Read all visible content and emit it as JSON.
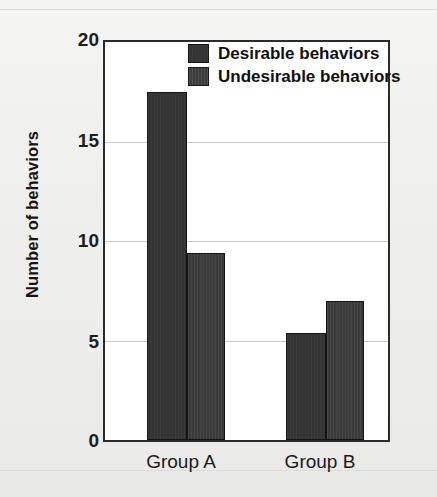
{
  "chart_data": {
    "type": "bar",
    "title": "",
    "subtitle": "",
    "xlabel": "",
    "ylabel": "Number of behaviors",
    "categories": [
      "Group A",
      "Group B"
    ],
    "series": [
      {
        "name": "Desirable behaviors",
        "values": [
          17.5,
          5.4
        ],
        "color": "#333333"
      },
      {
        "name": "Undesirable behaviors",
        "values": [
          9.4,
          7.0
        ],
        "color": "#3d3d3d"
      }
    ],
    "ylim": [
      0,
      20
    ],
    "yticks": [
      0,
      5,
      10,
      15,
      20
    ],
    "ytick_labels": [
      "0",
      "5",
      "10",
      "15",
      "20"
    ],
    "grid": true,
    "grid_axis": "y",
    "legend_position": "top-right-inside",
    "bar_border_color": "#141414",
    "plot_background": "#ffffff",
    "figure_background": "#efefed",
    "axis_color": "#2b2b2b",
    "gridline_color": "#c9c9c9"
  },
  "axis": {
    "y_title": "Number of behaviors",
    "ticks": [
      {
        "value": 20,
        "label": "20"
      },
      {
        "value": 15,
        "label": "15"
      },
      {
        "value": 10,
        "label": "10"
      },
      {
        "value": 5,
        "label": "5"
      },
      {
        "value": 0,
        "label": "0"
      }
    ]
  },
  "x_labels": [
    {
      "label": "Group A"
    },
    {
      "label": "Group B"
    }
  ],
  "legend": {
    "items": [
      {
        "label": "Desirable behaviors",
        "swatch": "legend-swatch-desirable"
      },
      {
        "label": "Undesirable behaviors",
        "swatch": "legend-swatch-undesirable"
      }
    ]
  }
}
